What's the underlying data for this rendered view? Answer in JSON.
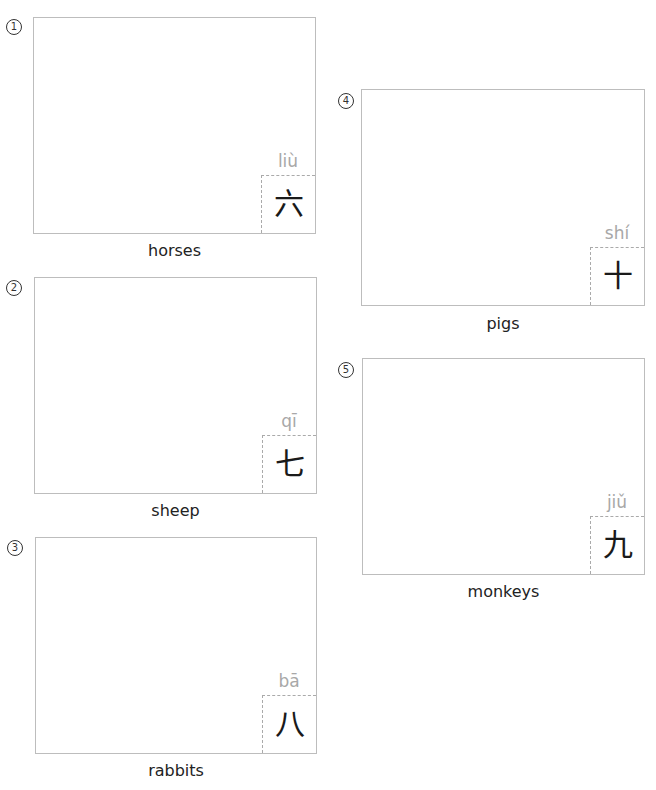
{
  "items": [
    {
      "number": "1",
      "label": "horses",
      "pinyin": "liù",
      "hanzi": "六"
    },
    {
      "number": "2",
      "label": "sheep",
      "pinyin": "qī",
      "hanzi": "七"
    },
    {
      "number": "3",
      "label": "rabbits",
      "pinyin": "bā",
      "hanzi": "八"
    },
    {
      "number": "4",
      "label": "pigs",
      "pinyin": "shí",
      "hanzi": "十"
    },
    {
      "number": "5",
      "label": "monkeys",
      "pinyin": "jiǔ",
      "hanzi": "九"
    }
  ],
  "colors": {
    "box_border": "#bdbdbd",
    "dashed": "#aaaaaa",
    "pinyin": "#a8a8a8",
    "text": "#222222"
  }
}
